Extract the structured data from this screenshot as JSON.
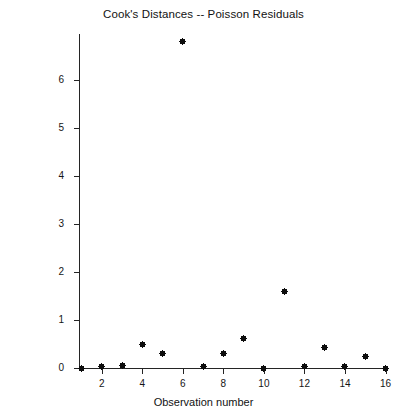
{
  "chart_data": {
    "type": "scatter",
    "title": "Cook's Distances -- Poisson Residuals",
    "xlabel": "Observation number",
    "ylabel": "Cook's distance",
    "x": [
      1,
      2,
      3,
      4,
      5,
      6,
      7,
      8,
      9,
      10,
      11,
      12,
      13,
      14,
      15,
      16
    ],
    "values": [
      0.0,
      0.04,
      0.06,
      0.48,
      0.3,
      6.81,
      0.03,
      0.3,
      0.62,
      0.0,
      1.6,
      0.03,
      0.43,
      0.03,
      0.25,
      0.0
    ],
    "series": [
      {
        "name": "Cook's distance",
        "values": [
          0.0,
          0.04,
          0.06,
          0.48,
          0.3,
          6.81,
          0.03,
          0.3,
          0.62,
          0.0,
          1.6,
          0.03,
          0.43,
          0.03,
          0.25,
          0.0
        ]
      }
    ],
    "xlim": [
      0.6,
      16.4
    ],
    "ylim": [
      0.0,
      7.0
    ],
    "x_ticks": [
      2,
      4,
      6,
      8,
      10,
      12,
      14,
      16
    ],
    "y_ticks": [
      0,
      1,
      2,
      3,
      4,
      5,
      6
    ],
    "x_tick_labels": [
      "2",
      "4",
      "6",
      "8",
      "10",
      "12",
      "14",
      "16"
    ],
    "y_tick_labels": [
      "0",
      "1",
      "2",
      "3",
      "4",
      "5",
      "6"
    ],
    "grid": false,
    "legend": null,
    "marker": "filled-square-with-cross",
    "marker_color": "#0d0d0d",
    "background_color": "#ffffff",
    "axis_color": "#242424"
  }
}
